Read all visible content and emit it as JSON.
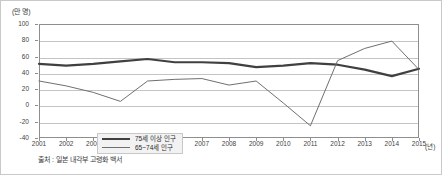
{
  "unit_label": "(만 명)",
  "xaxis_unit": "(년)",
  "source_note": "출처 : 일본 내각부 고령화 백서",
  "legend": {
    "position": "inside-bottom-left",
    "items": [
      {
        "label": "75세 이상 인구",
        "style": "thick",
        "color": "#404040"
      },
      {
        "label": "65~74세 인구",
        "style": "thin",
        "color": "#6f6f6f"
      }
    ]
  },
  "chart_data": {
    "type": "line",
    "title": "",
    "subtitle": "",
    "xlabel": "(년)",
    "ylabel": "(만 명)",
    "grid": true,
    "legend_position": "inside-bottom-left",
    "xlim": [
      2001,
      2015
    ],
    "ylim": [
      -40,
      100
    ],
    "ytick_step": 20,
    "categories": [
      "2001",
      "2002",
      "2003",
      "2004",
      "2005",
      "2006",
      "2007",
      "2008",
      "2009",
      "2010",
      "2011",
      "2012",
      "2013",
      "2014",
      "2015"
    ],
    "ytick_labels": [
      "100",
      "80",
      "60",
      "40",
      "20",
      "0",
      "-20",
      "-40"
    ],
    "ytick_values": [
      100,
      80,
      60,
      40,
      20,
      0,
      -20,
      -40
    ],
    "series": [
      {
        "name": "75세 이상 인구",
        "color": "#404040",
        "width": 2.2,
        "values": [
          51,
          49,
          51,
          54,
          57,
          53,
          53,
          52,
          47,
          49,
          52,
          50,
          44,
          36,
          45
        ]
      },
      {
        "name": "65~74세 인구",
        "color": "#6f6f6f",
        "width": 1,
        "values": [
          30,
          24,
          16,
          5,
          30,
          32,
          33,
          25,
          30,
          3,
          -25,
          55,
          70,
          79,
          44
        ]
      }
    ]
  }
}
